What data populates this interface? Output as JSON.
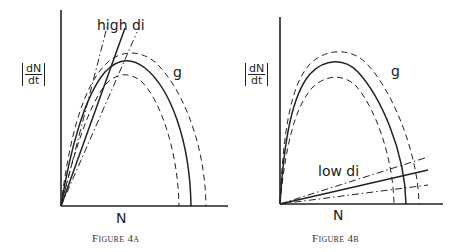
{
  "figures": [
    {
      "id": "4a",
      "caption": "Figure 4a",
      "y_axis_label": {
        "numerator": "dN",
        "denominator": "dt"
      },
      "x_axis_label": "N",
      "curve_label": "g",
      "line_label": "high di",
      "colors": {
        "ink": "#222222"
      }
    },
    {
      "id": "4b",
      "caption": "Figure 4b",
      "y_axis_label": {
        "numerator": "dN",
        "denominator": "dt"
      },
      "x_axis_label": "N",
      "curve_label": "g",
      "line_label": "low di",
      "colors": {
        "ink": "#222222"
      }
    }
  ]
}
